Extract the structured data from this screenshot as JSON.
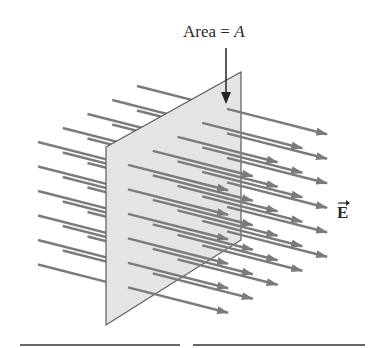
{
  "figure": {
    "area_label": {
      "text": "Area = ",
      "variable": "A"
    },
    "field_label": {
      "symbol": "E",
      "vector_arrow": "→"
    },
    "colors": {
      "arrow": "#7b7b7b",
      "plane_fill": "#e4e4e4",
      "plane_edge": "#5a5a5a",
      "pointer": "#222222",
      "text": "#2a2a2a"
    },
    "grid": {
      "layers": 5,
      "rows_per_layer": 6
    }
  }
}
